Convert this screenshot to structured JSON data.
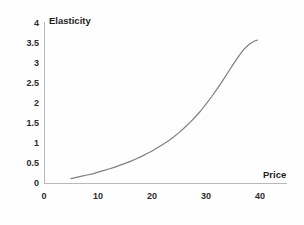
{
  "chart_data": {
    "type": "line",
    "title": "",
    "xlabel": "Price",
    "ylabel": "Elasticity",
    "xlim": [
      0,
      40
    ],
    "ylim": [
      0,
      4
    ],
    "grid": false,
    "legend": null,
    "x_ticks": [
      "0",
      "10",
      "20",
      "30",
      "40"
    ],
    "y_ticks": [
      "0",
      "0.5",
      "1",
      "1.5",
      "2",
      "2.5",
      "3",
      "3.5",
      "4"
    ],
    "x_tick_values": [
      0,
      10,
      20,
      30,
      40
    ],
    "y_tick_values": [
      0,
      0.5,
      1,
      1.5,
      2,
      2.5,
      3,
      3.5,
      4
    ],
    "series": [
      {
        "name": "Elasticity",
        "color": "#7f7f7f",
        "x": [
          5,
          6,
          7,
          8,
          9,
          10,
          11,
          12,
          13,
          14,
          15,
          16,
          17,
          18,
          19,
          20,
          21,
          22,
          23,
          24,
          25,
          26,
          27,
          28,
          29,
          30,
          31,
          32,
          33,
          34,
          35,
          36,
          37,
          38,
          39,
          39.5
        ],
        "y": [
          0.11,
          0.14,
          0.17,
          0.2,
          0.23,
          0.27,
          0.31,
          0.35,
          0.39,
          0.44,
          0.49,
          0.54,
          0.6,
          0.66,
          0.73,
          0.8,
          0.88,
          0.96,
          1.05,
          1.15,
          1.26,
          1.38,
          1.51,
          1.65,
          1.8,
          1.97,
          2.15,
          2.34,
          2.54,
          2.75,
          2.96,
          3.16,
          3.34,
          3.47,
          3.55,
          3.57
        ]
      }
    ]
  },
  "chart": {
    "y_axis_title": "Elasticity",
    "x_axis_title": "Price"
  }
}
